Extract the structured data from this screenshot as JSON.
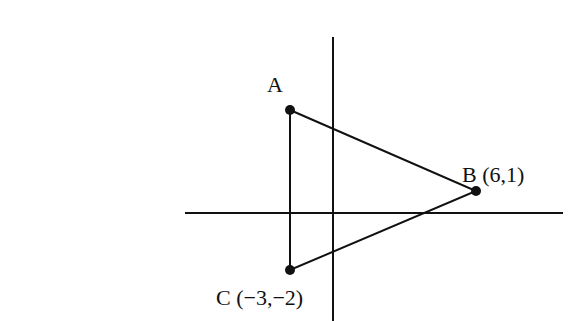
{
  "diagram": {
    "type": "coordinate-plane-triangle",
    "axes": {
      "x_axis": {
        "x1": 185,
        "y": 213,
        "x2": 563
      },
      "y_axis": {
        "x": 333,
        "y1": 37,
        "y2": 321
      }
    },
    "colors": {
      "stroke": "#111111",
      "point": "#111111",
      "background": "#ffffff"
    },
    "points": [
      {
        "id": "A",
        "label": "A",
        "coords": null,
        "px": 290,
        "py": 110
      },
      {
        "id": "B",
        "label": "B (6,1)",
        "coords": [
          6,
          1
        ],
        "px": 476,
        "py": 191
      },
      {
        "id": "C",
        "label": "C (−3,−2)",
        "coords": [
          -3,
          -2
        ],
        "px": 290,
        "py": 270
      }
    ],
    "labels": {
      "A": "A",
      "B": "B (6,1)",
      "C": "C (−3,−2)"
    }
  }
}
